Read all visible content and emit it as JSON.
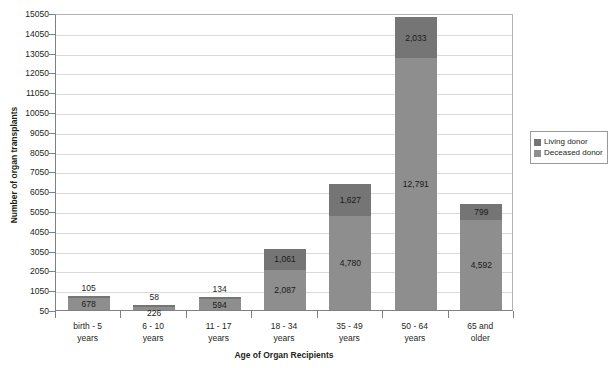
{
  "chart_data": {
    "type": "bar",
    "subtype": "stacked-bar",
    "title": "",
    "xlabel": "Age of Organ Recipients",
    "ylabel": "Number of organ transplants",
    "categories": [
      "birth - 5 years",
      "6 - 10 years",
      "11 - 17 years",
      "18 - 34 years",
      "35 - 49 years",
      "50 - 64 years",
      "65 and older"
    ],
    "category_lines": [
      [
        "birth - 5",
        "years"
      ],
      [
        "6 - 10",
        "years"
      ],
      [
        "11 - 17",
        "years"
      ],
      [
        "18 - 34",
        "years"
      ],
      [
        "35 - 49",
        "years"
      ],
      [
        "50 - 64",
        "years"
      ],
      [
        "65 and",
        "older"
      ]
    ],
    "series": [
      {
        "name": "Living donor",
        "color": "#757575",
        "values": [
          105,
          58,
          134,
          1061,
          1627,
          2033,
          799
        ],
        "labels": [
          "105",
          "58",
          "134",
          "1,061",
          "1,627",
          "2,033",
          "799"
        ]
      },
      {
        "name": "Deceased donor",
        "color": "#8e8e8e",
        "values": [
          678,
          226,
          594,
          2087,
          4780,
          12791,
          4592
        ],
        "labels": [
          "678",
          "226",
          "594",
          "2,087",
          "4,780",
          "12,791",
          "4,592"
        ]
      }
    ],
    "totals": [
      783,
      284,
      728,
      3148,
      6407,
      14824,
      5391
    ],
    "ylim": [
      50,
      15050
    ],
    "ytick_step": 1000,
    "yticks": [
      50,
      1050,
      2050,
      3050,
      4050,
      5050,
      6050,
      7050,
      8050,
      9050,
      10050,
      11050,
      12050,
      13050,
      14050,
      15050
    ],
    "ytick_labels": [
      "50",
      "1050",
      "2050",
      "3050",
      "4050",
      "5050",
      "6050",
      "7050",
      "8050",
      "9050",
      "10050",
      "11050",
      "12050",
      "13050",
      "14050",
      "15050"
    ],
    "grid": true,
    "grid_axis": "y",
    "legend_position": "right",
    "legend_entries": [
      "Living donor",
      "Deceased donor"
    ],
    "label_placement": {
      "living_outside_for": [
        "birth - 5 years",
        "6 - 10 years",
        "11 - 17 years"
      ],
      "note": "Small living-donor segments have their value label drawn above the bar"
    }
  }
}
